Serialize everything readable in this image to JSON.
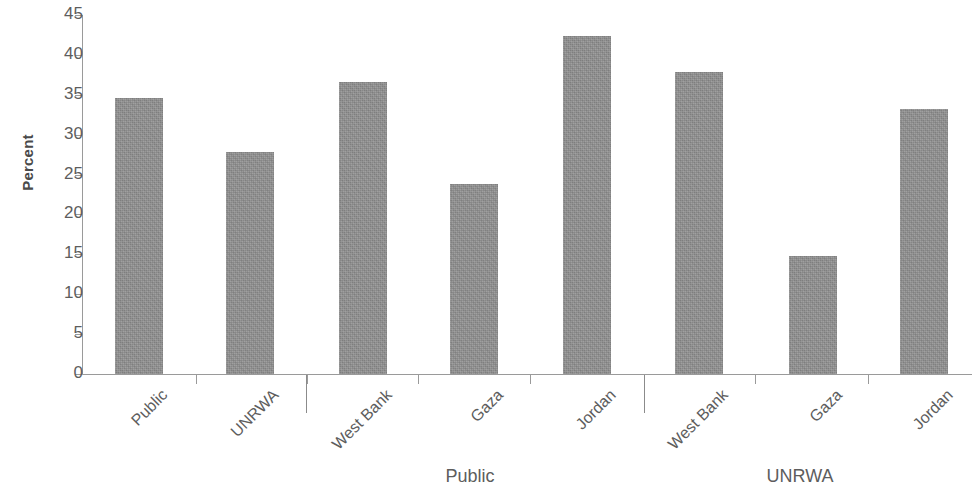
{
  "chart_data": {
    "type": "bar",
    "title": "",
    "xlabel": "",
    "ylabel": "Percent",
    "ylim": [
      0,
      45
    ],
    "ytick_values": [
      0,
      5,
      10,
      15,
      20,
      25,
      30,
      35,
      40,
      45
    ],
    "ytick_labels": [
      "0",
      "5",
      "10",
      "15",
      "20",
      "25",
      "30",
      "35",
      "40",
      "45"
    ],
    "grid": false,
    "legend": "none",
    "bar_color": "#909090",
    "axis_color": "#9a9a9a",
    "text_color": "#5d5d5d",
    "categories": [
      "Public",
      "UNRWA",
      "West Bank",
      "Gaza",
      "Jordan",
      "West Bank",
      "Gaza",
      "Jordan"
    ],
    "values": [
      34.6,
      27.8,
      36.6,
      23.8,
      42.4,
      37.9,
      14.8,
      33.2
    ],
    "groups": [
      {
        "label": "",
        "categories": [
          "Public",
          "UNRWA"
        ],
        "values": [
          34.6,
          27.8
        ]
      },
      {
        "label": "Public",
        "categories": [
          "West Bank",
          "Gaza",
          "Jordan"
        ],
        "values": [
          36.6,
          23.8,
          42.4
        ]
      },
      {
        "label": "UNRWA",
        "categories": [
          "West Bank",
          "Gaza",
          "Jordan"
        ],
        "values": [
          37.9,
          14.8,
          33.2
        ]
      }
    ]
  },
  "axis": {
    "y_title": "Percent",
    "yticks": [
      "45",
      "40",
      "35",
      "30",
      "25",
      "20",
      "15",
      "10",
      "5",
      "0"
    ]
  },
  "xlabels": [
    "Public",
    "UNRWA",
    "West Bank",
    "Gaza",
    "Jordan",
    "West Bank",
    "Gaza",
    "Jordan"
  ],
  "group_labels": [
    "Public",
    "UNRWA"
  ]
}
